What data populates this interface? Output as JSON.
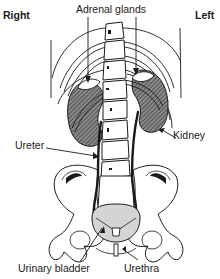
{
  "diagram": {
    "orientation": {
      "left_side_label": "Right",
      "right_side_label": "Left"
    },
    "labels": {
      "adrenal_glands": "Adrenal glands",
      "kidney": "Kidney",
      "ureter": "Ureter",
      "urinary_bladder": "Urinary bladder",
      "urethra": "Urethra"
    },
    "structures": [
      {
        "id": "spine",
        "name": "Vertebral column"
      },
      {
        "id": "ribs",
        "name": "Ribs"
      },
      {
        "id": "kidney-right",
        "name": "Right kidney"
      },
      {
        "id": "kidney-left",
        "name": "Left kidney"
      },
      {
        "id": "adrenal-right",
        "name": "Right adrenal gland"
      },
      {
        "id": "adrenal-left",
        "name": "Left adrenal gland"
      },
      {
        "id": "ureter-right",
        "name": "Right ureter"
      },
      {
        "id": "ureter-left",
        "name": "Left ureter"
      },
      {
        "id": "pelvis",
        "name": "Pelvic bones"
      },
      {
        "id": "bladder",
        "name": "Urinary bladder"
      },
      {
        "id": "urethra",
        "name": "Urethra"
      }
    ],
    "colors": {
      "ink": "#1a1a1a",
      "kidney_fill": "#6e6e6e",
      "bladder_fill": "#d4d4d4",
      "bone_fill": "#ffffff"
    }
  }
}
